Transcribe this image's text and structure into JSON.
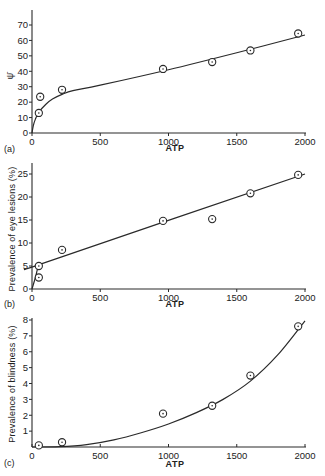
{
  "chart_data": [
    {
      "panel": "(a)",
      "type": "scatter",
      "title": "",
      "xlabel": "ATP",
      "ylabel": "ψ̄",
      "xlim": [
        0,
        2000
      ],
      "ylim": [
        0,
        78
      ],
      "xticks": [
        0,
        500,
        1000,
        1500,
        2000
      ],
      "yticks": [
        0,
        10,
        20,
        30,
        40,
        50,
        60,
        70
      ],
      "grid": false,
      "legend": null,
      "series": [
        {
          "name": "observed",
          "marker": "circle-dot",
          "x": [
            50,
            60,
            220,
            960,
            1320,
            1600,
            1950
          ],
          "y": [
            13,
            23.5,
            28,
            41.5,
            46,
            53.5,
            64.5
          ]
        },
        {
          "name": "fitted curve",
          "line": true,
          "x": [
            0,
            10,
            25,
            50,
            100,
            150,
            220,
            300,
            500,
            1000,
            1500,
            2000
          ],
          "y": [
            0,
            5,
            9,
            13.5,
            18.5,
            22,
            25,
            27.5,
            31,
            41,
            52,
            63.5
          ]
        }
      ]
    },
    {
      "panel": "(b)",
      "type": "scatter",
      "title": "",
      "xlabel": "ATP",
      "ylabel": "Prevalence of eye lesions (%)",
      "xlim": [
        0,
        2000
      ],
      "ylim": [
        0,
        27
      ],
      "xticks": [
        0,
        500,
        1000,
        1500,
        2000
      ],
      "yticks": [
        0,
        5,
        10,
        15,
        20,
        25
      ],
      "grid": false,
      "legend": null,
      "series": [
        {
          "name": "observed",
          "marker": "circle-dot",
          "x": [
            50,
            50,
            220,
            960,
            1320,
            1600,
            1950
          ],
          "y": [
            2.5,
            5,
            8.5,
            14.8,
            15.2,
            20.8,
            24.8
          ]
        },
        {
          "name": "fitted curve",
          "line": true,
          "x": [
            0,
            25,
            50,
            100,
            2000
          ],
          "y": [
            0,
            2.5,
            5,
            5.8,
            25
          ]
        }
      ]
    },
    {
      "panel": "(c)",
      "type": "scatter",
      "title": "",
      "xlabel": "ATP",
      "ylabel": "Prevalence of blindness (%)",
      "xlim": [
        0,
        2000
      ],
      "ylim": [
        0,
        8.3
      ],
      "xticks": [
        0,
        500,
        1000,
        1500,
        2000
      ],
      "yticks": [
        1,
        2,
        3,
        4,
        5,
        6,
        7,
        8
      ],
      "grid": false,
      "legend": null,
      "series": [
        {
          "name": "observed",
          "marker": "circle-dot",
          "x": [
            50,
            220,
            960,
            1320,
            1600,
            1950
          ],
          "y": [
            0.1,
            0.3,
            2.1,
            2.6,
            4.5,
            7.6
          ]
        },
        {
          "name": "fitted curve",
          "line": true,
          "x": [
            0,
            200,
            400,
            600,
            800,
            1000,
            1200,
            1400,
            1600,
            1800,
            2000
          ],
          "y": [
            0,
            0.02,
            0.15,
            0.45,
            0.9,
            1.45,
            2.15,
            3.0,
            4.15,
            5.8,
            7.95
          ]
        }
      ]
    }
  ],
  "panels": {
    "a": {
      "label": "(a)",
      "xlabel": "ATP",
      "ylabel": "ψ̄"
    },
    "b": {
      "label": "(b)",
      "xlabel": "ATP",
      "ylabel": "Prevalence of eye lesions (%)"
    },
    "c": {
      "label": "(c)",
      "xlabel": "ATP",
      "ylabel": "Prevalence of blindness (%)"
    }
  },
  "style": {
    "ink": "#2a2a2a",
    "background": "#ffffff"
  }
}
